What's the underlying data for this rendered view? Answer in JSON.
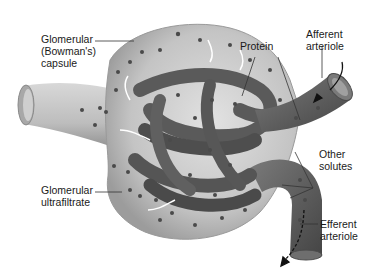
{
  "diagram": {
    "labels": {
      "capsule": [
        "Glomerular",
        "(Bowman's)",
        "capsule"
      ],
      "protein": [
        "Protein"
      ],
      "afferent": [
        "Afferent",
        "arteriole"
      ],
      "other_solutes": [
        "Other",
        "solutes"
      ],
      "ultrafiltrate": [
        "Glomerular",
        "ultrafiltrate"
      ],
      "efferent": [
        "Efferent",
        "arteriole"
      ]
    },
    "colors": {
      "background": "#ffffff",
      "capsule_fill": "#c9c9c9",
      "capsule_shade": "#9a9a9a",
      "capillary": "#5e5e5e",
      "capillary_dark": "#3f3f3f",
      "particle": "#4a4a4a",
      "text": "#1a1a1a",
      "leader_line": "#333333"
    }
  }
}
